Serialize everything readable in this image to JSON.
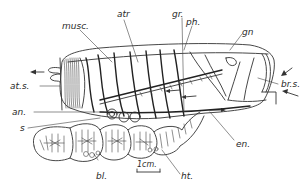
{
  "figure": {
    "type": "anatomical line drawing",
    "labels": [
      {
        "id": "musc",
        "text": "musc."
      },
      {
        "id": "atr",
        "text": "atr"
      },
      {
        "id": "gr",
        "text": "gr."
      },
      {
        "id": "ph",
        "text": "ph."
      },
      {
        "id": "gn",
        "text": "gn"
      },
      {
        "id": "brs",
        "text": "br.s."
      },
      {
        "id": "ats",
        "text": "at.s."
      },
      {
        "id": "an",
        "text": "an."
      },
      {
        "id": "s",
        "text": "s"
      },
      {
        "id": "en",
        "text": "en."
      },
      {
        "id": "bl",
        "text": "bl."
      },
      {
        "id": "ht",
        "text": "ht."
      }
    ],
    "scale_bar": {
      "text": "1cm."
    },
    "colors": {
      "ink": "#333333",
      "paper": "#ffffff"
    }
  }
}
